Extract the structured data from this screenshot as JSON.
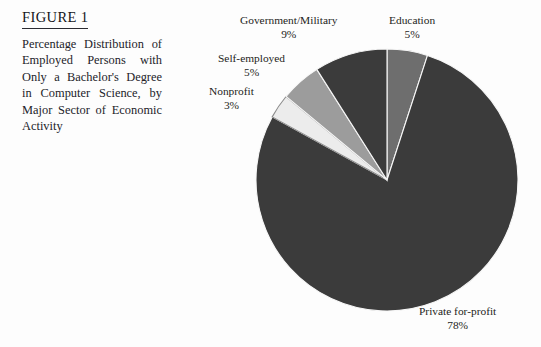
{
  "figure": {
    "label": "FIGURE 1",
    "caption": "Percentage Distribution of Employed Persons with Only a Bachelor's Degree in Computer Science, by Major Sector of Economic Activity"
  },
  "labels": {
    "government": {
      "name": "Government/Military",
      "pct": "9%"
    },
    "education": {
      "name": "Education",
      "pct": "5%"
    },
    "self": {
      "name": "Self-employed",
      "pct": "5%"
    },
    "nonprofit": {
      "name": "Nonprofit",
      "pct": "3%"
    },
    "private": {
      "name": "Private for-profit",
      "pct": "78%"
    }
  },
  "chart_data": {
    "type": "pie",
    "title": "Percentage Distribution of Employed Persons with Only a Bachelor's Degree in Computer Science, by Major Sector of Economic Activity",
    "categories": [
      "Education",
      "Private for-profit",
      "Nonprofit",
      "Self-employed",
      "Government/Military"
    ],
    "values": [
      5,
      78,
      3,
      5,
      9
    ],
    "unit": "percent",
    "total": 100,
    "start_angle_deg": 0,
    "direction": "clockwise",
    "legend": "none",
    "data_labels": true,
    "colors": [
      "#6e6e6e",
      "#3b3b3b",
      "#ececec",
      "#9c9c9c",
      "#3b3b3b"
    ],
    "slices": [
      {
        "label": "Education",
        "value": 5,
        "pct_text": "5%",
        "color": "#6e6e6e"
      },
      {
        "label": "Private for-profit",
        "value": 78,
        "pct_text": "78%",
        "color": "#3b3b3b"
      },
      {
        "label": "Nonprofit",
        "value": 3,
        "pct_text": "3%",
        "color": "#ececec"
      },
      {
        "label": "Self-employed",
        "value": 5,
        "pct_text": "5%",
        "color": "#9c9c9c"
      },
      {
        "label": "Government/Military",
        "value": 9,
        "pct_text": "9%",
        "color": "#3b3b3b"
      }
    ]
  }
}
